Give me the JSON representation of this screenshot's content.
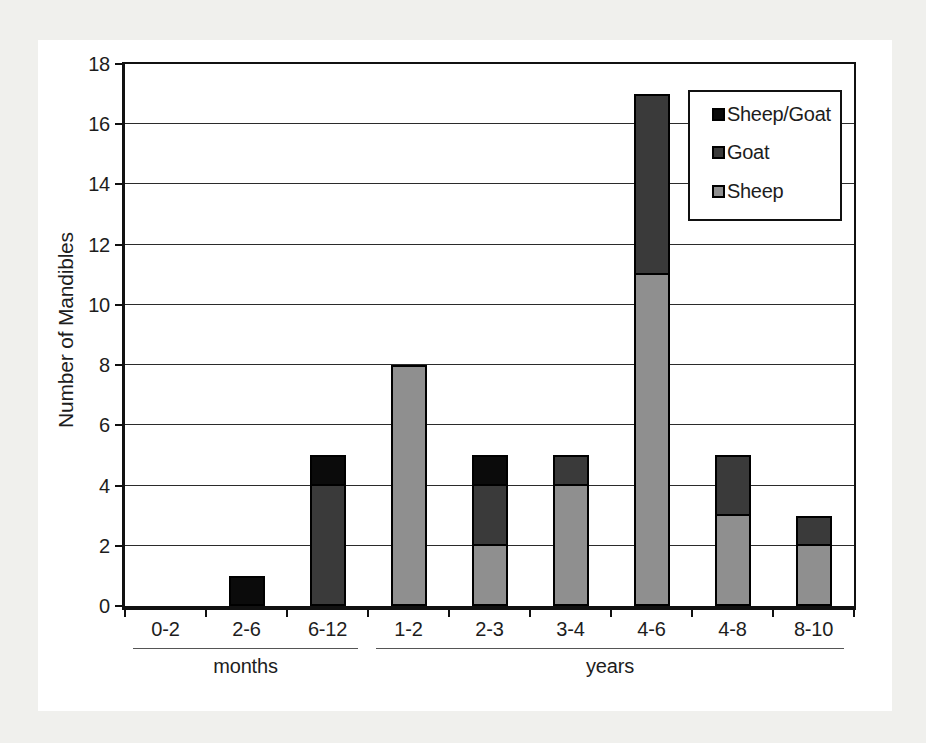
{
  "page": {
    "background_color": "#f0f0ed",
    "panel_color": "#ffffff"
  },
  "chart_data": {
    "type": "bar",
    "stacked": true,
    "ylabel": "Number of Mandibles",
    "xlabel": "",
    "ylim": [
      0,
      18
    ],
    "ytick_step": 2,
    "grid": "horizontal",
    "legend_position": "top-right",
    "categories": [
      "0-2",
      "2-6",
      "6-12",
      "1-2",
      "2-3",
      "3-4",
      "4-6",
      "4-8",
      "8-10"
    ],
    "axis_groups": [
      {
        "label": "months",
        "start_index": 0,
        "end_index": 2
      },
      {
        "label": "years",
        "start_index": 3,
        "end_index": 8
      }
    ],
    "series": [
      {
        "name": "Sheep",
        "color": "#8f8f8f",
        "values": [
          0,
          0,
          0,
          8,
          2,
          4,
          11,
          3,
          2
        ]
      },
      {
        "name": "Goat",
        "color": "#3a3a3a",
        "values": [
          0,
          0,
          4,
          0,
          2,
          1,
          6,
          2,
          1
        ]
      },
      {
        "name": "Sheep/Goat",
        "color": "#0b0b0b",
        "values": [
          0,
          1,
          1,
          0,
          1,
          0,
          0,
          0,
          0
        ]
      }
    ],
    "legend_order": [
      "Sheep/Goat",
      "Goat",
      "Sheep"
    ],
    "colors": {
      "axis": "#111111",
      "gridline": "#2b2b2b",
      "group_line": "#555555",
      "text": "#1d1d1d",
      "bar_border": "#000000"
    }
  }
}
